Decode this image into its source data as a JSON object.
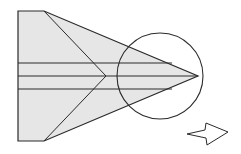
{
  "diagram": {
    "colors": {
      "paper_fill": "#e6e6e6",
      "stroke": "#2a2a2a",
      "background": "#ffffff",
      "arrow_fill": "#ffffff"
    },
    "paper_outline": [
      [
        18,
        11
      ],
      [
        44,
        11
      ],
      [
        198,
        76
      ],
      [
        44,
        141
      ],
      [
        18,
        141
      ]
    ],
    "fold_lines": [
      {
        "name": "upper-diagonal-crease",
        "points": [
          [
            44,
            11
          ],
          [
            106,
            76
          ]
        ]
      },
      {
        "name": "lower-diagonal-crease",
        "points": [
          [
            44,
            141
          ],
          [
            106,
            76
          ]
        ]
      },
      {
        "name": "upper-horizontal-line",
        "points": [
          [
            18,
            63
          ],
          [
            172,
            63
          ]
        ]
      },
      {
        "name": "center-line",
        "points": [
          [
            18,
            76
          ],
          [
            198,
            76
          ]
        ]
      },
      {
        "name": "lower-horizontal-line",
        "points": [
          [
            18,
            89
          ],
          [
            172,
            89
          ]
        ]
      }
    ],
    "detail_circle": {
      "cx": 160,
      "cy": 76,
      "r": 43
    },
    "direction_arrow": {
      "points": [
        [
          187,
          134
        ],
        [
          205,
          130
        ],
        [
          206,
          123
        ],
        [
          228,
          132
        ],
        [
          207,
          145
        ],
        [
          206,
          138
        ]
      ],
      "meaning": "turn-over / next-step arrow pointing right"
    }
  }
}
